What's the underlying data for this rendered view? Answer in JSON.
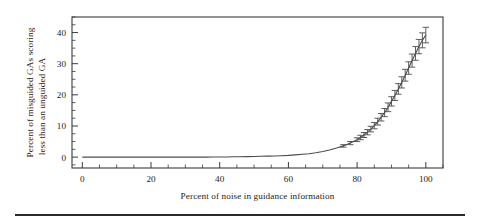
{
  "figure": {
    "background_color": "#ffffff",
    "line_color": "#4c4c4c",
    "axis_color": "#3a3a3a",
    "footer_rule_color": "#2b2b2b"
  },
  "chart_data": {
    "type": "line",
    "title": "",
    "subtitle": "",
    "xlabel": "Percent of noise in guidance information",
    "ylabel": "Percent of misguided GAs scoring less than an unguided GA",
    "ylabel_line1": "Percent of misguided GAs scoring",
    "ylabel_line2": "less than an unguided GA",
    "xlim": [
      -3,
      105
    ],
    "ylim": [
      -3.5,
      45
    ],
    "xticks": [
      0,
      20,
      40,
      60,
      80,
      100
    ],
    "yticks": [
      0,
      10,
      20,
      30,
      40
    ],
    "xtick_labels": [
      "0",
      "20",
      "40",
      "60",
      "80",
      "100"
    ],
    "ytick_labels": [
      "0",
      "10",
      "20",
      "30",
      "40"
    ],
    "x_minor_interval": 5,
    "y_minor_interval": 2.5,
    "grid": false,
    "legend": false,
    "legend_position": "none",
    "errorbars": true,
    "x": [
      0,
      2,
      4,
      6,
      8,
      10,
      12,
      14,
      16,
      18,
      20,
      22,
      24,
      26,
      28,
      30,
      32,
      34,
      36,
      38,
      40,
      42,
      44,
      46,
      48,
      50,
      52,
      54,
      56,
      58,
      60,
      62,
      64,
      66,
      68,
      70,
      72,
      74,
      76,
      78,
      80,
      81,
      82,
      83,
      84,
      85,
      86,
      87,
      88,
      89,
      90,
      91,
      92,
      93,
      94,
      95,
      96,
      97,
      98,
      99,
      100
    ],
    "y": [
      0.0,
      0.0,
      0.0,
      0.0,
      0.0,
      0.0,
      0.0,
      0.0,
      0.0,
      0.0,
      0.0,
      0.0,
      0.0,
      0.0,
      0.0,
      0.0,
      0.0,
      0.0,
      0.0,
      0.05,
      0.05,
      0.05,
      0.1,
      0.1,
      0.15,
      0.2,
      0.25,
      0.3,
      0.35,
      0.45,
      0.55,
      0.7,
      0.9,
      1.1,
      1.4,
      1.8,
      2.3,
      2.9,
      3.6,
      4.5,
      5.6,
      6.3,
      7.1,
      8.0,
      9.0,
      10.1,
      11.4,
      12.8,
      14.3,
      16.0,
      17.9,
      19.8,
      21.9,
      24.0,
      26.3,
      28.6,
      31.0,
      33.3,
      35.5,
      37.5,
      39.2
    ],
    "yerr": [
      0,
      0,
      0,
      0,
      0,
      0,
      0,
      0,
      0,
      0,
      0,
      0,
      0,
      0,
      0,
      0,
      0,
      0,
      0,
      0,
      0,
      0,
      0,
      0,
      0,
      0,
      0,
      0,
      0,
      0,
      0,
      0,
      0,
      0,
      0,
      0,
      0,
      0,
      0.4,
      0.5,
      0.6,
      0.7,
      0.8,
      0.85,
      0.9,
      1.0,
      1.1,
      1.2,
      1.3,
      1.4,
      1.5,
      1.6,
      1.7,
      1.8,
      1.9,
      2.0,
      2.1,
      2.2,
      2.3,
      2.4,
      2.5
    ]
  }
}
